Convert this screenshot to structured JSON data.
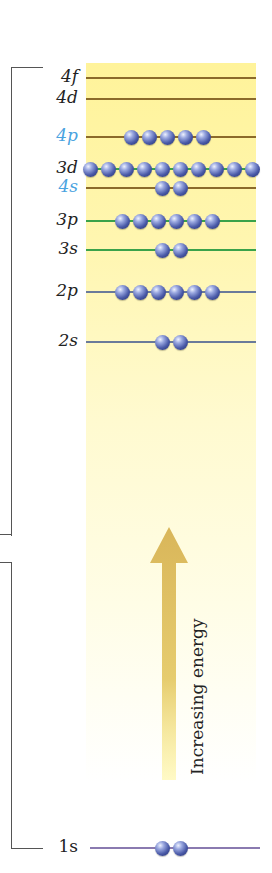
{
  "diagram": {
    "arrow_label": "Increasing energy",
    "colors": {
      "n4_line": "#8b6a2a",
      "n3_line": "#3aa24a",
      "n2_line": "#6a7a9a",
      "n1_line": "#8a7ab0",
      "label_dark": "#222222",
      "label_blue": "#4aa3df",
      "arrow": "#d9b65a",
      "electron": "#4a5aa8"
    },
    "levels": [
      {
        "label": "4f",
        "electrons": 0,
        "y": 78,
        "line_color": "#8b6a2a",
        "label_color": "dark"
      },
      {
        "label": "4d",
        "electrons": 0,
        "y": 99,
        "line_color": "#8b6a2a",
        "label_color": "dark"
      },
      {
        "label": "4p",
        "electrons": 5,
        "y": 137,
        "line_color": "#8b6a2a",
        "label_color": "blue"
      },
      {
        "label": "3d",
        "electrons": 10,
        "y": 169,
        "line_color": "#3aa24a",
        "label_color": "dark"
      },
      {
        "label": "4s",
        "electrons": 2,
        "y": 188,
        "line_color": "#8b6a2a",
        "label_color": "blue"
      },
      {
        "label": "3p",
        "electrons": 6,
        "y": 221,
        "line_color": "#3aa24a",
        "label_color": "dark"
      },
      {
        "label": "3s",
        "electrons": 2,
        "y": 250,
        "line_color": "#3aa24a",
        "label_color": "dark"
      },
      {
        "label": "2p",
        "electrons": 6,
        "y": 292,
        "line_color": "#6a7a9a",
        "label_color": "dark"
      },
      {
        "label": "2s",
        "electrons": 2,
        "y": 342,
        "line_color": "#6a7a9a",
        "label_color": "dark"
      },
      {
        "label": "1s",
        "electrons": 2,
        "y": 848,
        "line_color": "#8a7ab0",
        "label_color": "dark"
      }
    ]
  }
}
